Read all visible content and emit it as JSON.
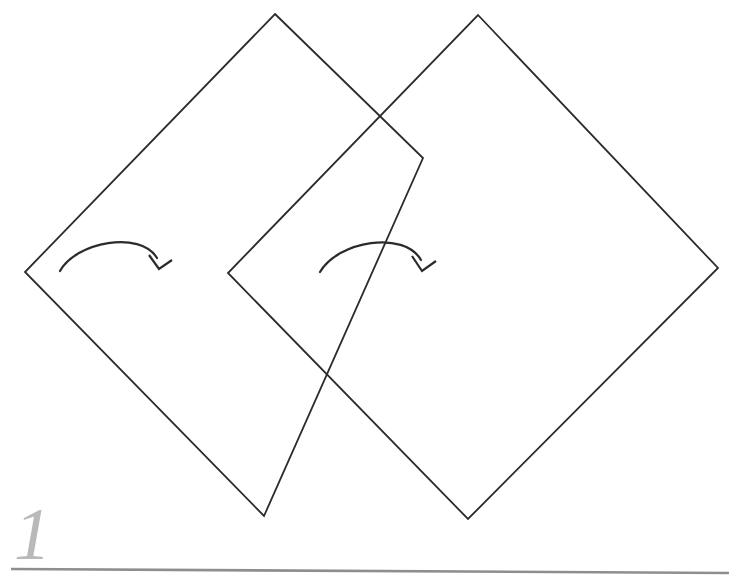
{
  "figure": {
    "page_number": "1",
    "background_color": "#ffffff",
    "stroke_color": "#2b2b2b",
    "accent_gray": "#b9b9b9",
    "rule_color": "#8e8e8e",
    "canvas": {
      "width": 732,
      "height": 581
    }
  },
  "shapes": {
    "left_diamond": {
      "name": "left-rotated-square",
      "points": "275,14 423,158 264,516 25,272",
      "stroke": "#2b2b2b",
      "stroke_width": 1.8,
      "fill": "none"
    },
    "right_diamond": {
      "name": "right-rotated-square",
      "points": "478,15 718,268 468,519 228,273",
      "stroke": "#2b2b2b",
      "stroke_width": 1.8,
      "fill": "none"
    }
  },
  "arrows": [
    {
      "name": "rotation-arrow-left",
      "label": "rotation arrow over left square",
      "path": "M 60,271 C 76,242 140,230 157,258",
      "head": "M 149,255 L 159,269 L 172,260",
      "stroke": "#2b2b2b",
      "stroke_width": 2.2
    },
    {
      "name": "rotation-arrow-right",
      "label": "rotation arrow over right square",
      "path": "M 320,272 C 338,241 404,230 421,260",
      "head": "M 412,256 L 422,271 L 436,261",
      "stroke": "#2b2b2b",
      "stroke_width": 2.2
    }
  ],
  "footer": {
    "rule": {
      "name": "footer-rule",
      "x1": 11,
      "y1": 569,
      "x2": 729,
      "y2": 573,
      "color": "#8e8e8e",
      "width": 2.6
    },
    "page_number": "1",
    "page_number_position": {
      "x": 14,
      "y": 559
    }
  }
}
